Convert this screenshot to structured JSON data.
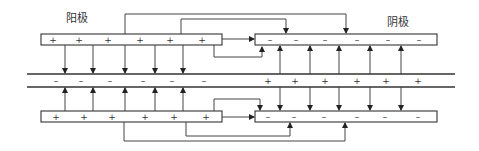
{
  "labels": {
    "anode": "阳极",
    "cathode": "阴极"
  },
  "top_anode": {
    "signs": [
      "+",
      "+",
      "+",
      "+",
      "+",
      "+"
    ]
  },
  "top_cathode": {
    "signs": [
      "–",
      "–",
      "–",
      "–",
      "–",
      "–"
    ]
  },
  "band_left": {
    "signs": [
      "–",
      "–",
      "–",
      "–",
      "–",
      "–"
    ]
  },
  "band_right": {
    "signs": [
      "+",
      "+",
      "+",
      "+",
      "+",
      "+"
    ]
  },
  "bottom_anode": {
    "signs": [
      "+",
      "+",
      "+",
      "+",
      "+",
      "+"
    ]
  },
  "bottom_cathode": {
    "signs": [
      "–",
      "–",
      "–",
      "–",
      "–",
      "–"
    ]
  }
}
